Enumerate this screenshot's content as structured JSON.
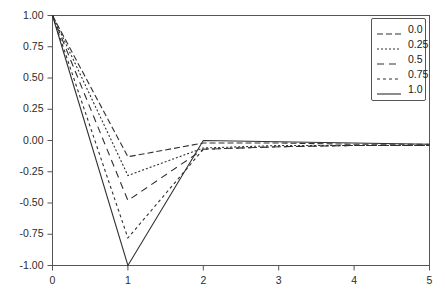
{
  "chart_data": {
    "type": "line",
    "title": "",
    "xlabel": "",
    "ylabel": "",
    "xlim": [
      0,
      5
    ],
    "ylim": [
      -1.0,
      1.0
    ],
    "grid": false,
    "legend_position": "top-right",
    "legend_title": "",
    "x_ticks": [
      "0",
      "1",
      "2",
      "3",
      "4",
      "5"
    ],
    "x_tick_values": [
      0,
      1,
      2,
      3,
      4,
      5
    ],
    "y_ticks": [
      "1.00",
      "0.75",
      "0.50",
      "0.25",
      "0.00",
      "-0.25",
      "-0.50",
      "-0.75",
      "-1.00"
    ],
    "y_tick_values": [
      1.0,
      0.75,
      0.5,
      0.25,
      0.0,
      -0.25,
      -0.5,
      -0.75,
      -1.0
    ],
    "x": [
      0,
      1,
      2,
      3,
      4,
      5
    ],
    "series": [
      {
        "name": "0.0",
        "label": "0.0",
        "dash": "6,3",
        "color": "#303030",
        "values": [
          1.0,
          -0.13,
          -0.02,
          -0.02,
          -0.03,
          -0.03
        ]
      },
      {
        "name": "0.25",
        "label": "0.25",
        "dash": "2,2",
        "color": "#303030",
        "values": [
          1.0,
          -0.28,
          -0.06,
          -0.04,
          -0.04,
          -0.04
        ]
      },
      {
        "name": "0.5",
        "label": "0.5",
        "dash": "7,5",
        "color": "#303030",
        "values": [
          1.0,
          -0.48,
          -0.07,
          -0.05,
          -0.04,
          -0.04
        ]
      },
      {
        "name": "0.75",
        "label": "0.75",
        "dash": "3,3",
        "color": "#303030",
        "values": [
          1.0,
          -0.78,
          -0.07,
          -0.05,
          -0.04,
          -0.04
        ]
      },
      {
        "name": "1.0",
        "label": "1.0",
        "dash": "none",
        "color": "#303030",
        "values": [
          1.0,
          -1.0,
          0.0,
          -0.01,
          -0.02,
          -0.03
        ]
      }
    ]
  },
  "axes": {
    "y_labels": [
      "1.00",
      "0.75",
      "0.50",
      "0.25",
      "0.00",
      "-0.25",
      "-0.50",
      "-0.75",
      "-1.00"
    ],
    "x_labels": [
      "0",
      "1",
      "2",
      "3",
      "4",
      "5"
    ]
  },
  "legend": {
    "entries": [
      {
        "label": "0.0"
      },
      {
        "label": "0.25"
      },
      {
        "label": "0.5"
      },
      {
        "label": "0.75"
      },
      {
        "label": "1.0"
      }
    ]
  }
}
